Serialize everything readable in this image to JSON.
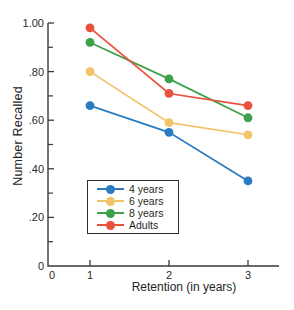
{
  "chart_data": {
    "type": "line",
    "x": [
      1,
      2,
      3
    ],
    "xlabel": "Retention (in years)",
    "ylabel": "Number Recalled",
    "xlim": [
      0,
      3.4
    ],
    "ylim": [
      0,
      1.0
    ],
    "xtick_labels": [
      "0",
      "1",
      "2",
      "3"
    ],
    "ytick_labels": [
      "0",
      ".20",
      ".40",
      ".60",
      ".80",
      "1.00"
    ],
    "ytick_values": [
      0,
      0.2,
      0.4,
      0.6,
      0.8,
      1.0
    ],
    "minor_ytick_values": [
      0.1,
      0.3,
      0.5,
      0.7,
      0.9
    ],
    "grid": false,
    "legend_position": "lower-left-inside",
    "axis_color": "#3a3a3a",
    "text_color": "#2b2b2b",
    "series": [
      {
        "name": "4 years",
        "color": "#2b7bc2",
        "values": [
          0.66,
          0.55,
          0.35
        ]
      },
      {
        "name": "6 years",
        "color": "#f2c368",
        "values": [
          0.8,
          0.59,
          0.54
        ]
      },
      {
        "name": "8 years",
        "color": "#3da04a",
        "values": [
          0.92,
          0.77,
          0.61
        ]
      },
      {
        "name": "Adults",
        "color": "#e8513c",
        "values": [
          0.98,
          0.71,
          0.66
        ]
      }
    ]
  }
}
